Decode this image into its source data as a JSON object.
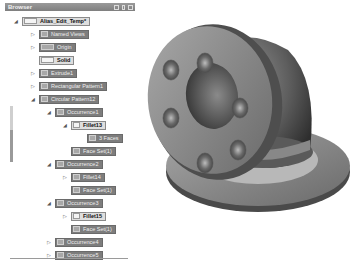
{
  "browser": {
    "title": "Browser",
    "header_icons": [
      "panel-icon",
      "pin-icon",
      "close-icon"
    ],
    "items": [
      {
        "label": "Alias_Edit_Temp*",
        "depth": 0,
        "toggle": "expanded",
        "style": "light",
        "icon": "part-icon"
      },
      {
        "label": "Named Views",
        "depth": 1,
        "toggle": "collapsed",
        "style": "dark",
        "icon": "folder-icon"
      },
      {
        "label": "Origin",
        "depth": 1,
        "toggle": "collapsed",
        "style": "dark",
        "icon": "folder-icon"
      },
      {
        "label": "Solid",
        "depth": 1,
        "toggle": "none",
        "style": "light",
        "icon": "solid-icon"
      },
      {
        "label": "Extrude1",
        "depth": 1,
        "toggle": "collapsed",
        "style": "dark",
        "icon": "extrude-icon"
      },
      {
        "label": "Rectangular Pattern1",
        "depth": 1,
        "toggle": "collapsed",
        "style": "dark",
        "icon": "pattern-icon"
      },
      {
        "label": "Circular Pattern12",
        "depth": 1,
        "toggle": "expanded",
        "style": "dark",
        "icon": "pattern-icon"
      },
      {
        "label": "Occurrence1",
        "depth": 2,
        "toggle": "expanded",
        "style": "dark",
        "icon": "occurrence-icon"
      },
      {
        "label": "Fillet13",
        "depth": 3,
        "toggle": "expanded",
        "style": "light",
        "icon": "fillet-icon"
      },
      {
        "label": "3 Faces",
        "depth": 4,
        "toggle": "none",
        "style": "dark",
        "icon": "face-icon"
      },
      {
        "label": "Face Set(1)",
        "depth": 3,
        "toggle": "none",
        "style": "dark",
        "icon": "face-icon"
      },
      {
        "label": "Occurrence2",
        "depth": 2,
        "toggle": "expanded",
        "style": "dark",
        "icon": "occurrence-icon"
      },
      {
        "label": "Fillet14",
        "depth": 3,
        "toggle": "collapsed",
        "style": "dark",
        "icon": "fillet-icon"
      },
      {
        "label": "Face Set(1)",
        "depth": 3,
        "toggle": "none",
        "style": "dark",
        "icon": "face-icon"
      },
      {
        "label": "Occurrence3",
        "depth": 2,
        "toggle": "expanded",
        "style": "dark",
        "icon": "occurrence-icon"
      },
      {
        "label": "Fillet15",
        "depth": 3,
        "toggle": "collapsed",
        "style": "light",
        "icon": "fillet-icon"
      },
      {
        "label": "Face Set(1)",
        "depth": 3,
        "toggle": "none",
        "style": "dark",
        "icon": "face-icon"
      },
      {
        "label": "Occurrence4",
        "depth": 2,
        "toggle": "collapsed",
        "style": "dark",
        "icon": "occurrence-icon"
      },
      {
        "label": "Occurrence5",
        "depth": 2,
        "toggle": "collapsed",
        "style": "dark",
        "icon": "occurrence-icon"
      }
    ]
  },
  "viewport": {
    "model": "pipe-elbow-with-flanges",
    "colors": {
      "body": "#6e6e6e",
      "flange": "#8a8a8a",
      "shadow": "#3c3c3c",
      "highlight": "#c8c8c8"
    }
  }
}
